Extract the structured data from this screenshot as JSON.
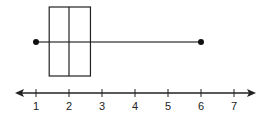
{
  "chart_data": {
    "type": "boxplot",
    "title": "",
    "xlabel": "",
    "ylabel": "",
    "min": 1,
    "q1": 1.4,
    "median": 2,
    "q3": 2.65,
    "max": 6,
    "axis": {
      "range": [
        0.4,
        7.6
      ],
      "ticks": [
        1,
        2,
        3,
        4,
        5,
        6,
        7
      ],
      "tick_labels": [
        "1",
        "2",
        "3",
        "4",
        "5",
        "6",
        "7"
      ],
      "arrows_both_ends": true
    },
    "grid": false,
    "legend": null
  },
  "colors": {
    "stroke": "#222222",
    "whisker": "#555555",
    "point": "#111111"
  }
}
